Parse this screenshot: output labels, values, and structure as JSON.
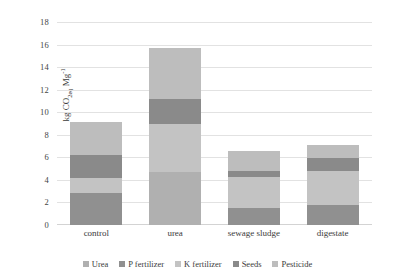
{
  "chart_data": {
    "type": "bar",
    "subtype": "stacked-bar",
    "title": "",
    "xlabel": "",
    "ylabel": "kg CO2eq Mg-1",
    "ylabel_parts": {
      "prefix": "kg CO",
      "sub": "2eq",
      "mid": " Mg",
      "sup": "-1"
    },
    "categories": [
      "control",
      "urea",
      "sewage sludge",
      "digestate"
    ],
    "ylim": [
      0,
      18
    ],
    "yticks": [
      0,
      2,
      4,
      6,
      8,
      10,
      12,
      14,
      16,
      18
    ],
    "grid": true,
    "grid_axis": "y",
    "legend_position": "bottom",
    "series": [
      {
        "name": "Urea",
        "color": "#b0b0b0",
        "values": [
          0.0,
          4.7,
          0.0,
          0.0
        ]
      },
      {
        "name": "P fertilizer",
        "color": "#909090",
        "values": [
          2.8,
          0.0,
          1.5,
          1.8
        ]
      },
      {
        "name": "K fertilizer",
        "color": "#c3c3c3",
        "values": [
          1.4,
          4.3,
          2.8,
          3.0
        ]
      },
      {
        "name": "Seeds",
        "color": "#8a8a8a",
        "values": [
          2.0,
          2.2,
          0.5,
          1.1
        ]
      },
      {
        "name": "Pesticide",
        "color": "#bdbdbd",
        "values": [
          2.9,
          4.5,
          1.8,
          1.2
        ]
      }
    ],
    "totals": [
      9.1,
      15.7,
      6.6,
      7.1
    ]
  },
  "legend": {
    "items": [
      {
        "label": "Urea"
      },
      {
        "label": "P fertilizer"
      },
      {
        "label": "K fertilizer"
      },
      {
        "label": "Seeds"
      },
      {
        "label": "Pesticide"
      }
    ]
  }
}
